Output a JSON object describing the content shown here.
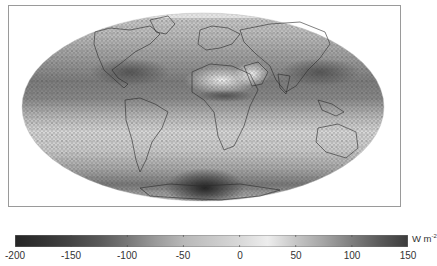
{
  "figure": {
    "projection": "Mollweide (global)",
    "map_description": "Global grayscale field with hatched stipple pattern; coastlines overlaid",
    "colorbar": {
      "unit": "W m",
      "unit_superscript": "-2",
      "min": -200,
      "max": 150,
      "ticks": [
        {
          "value": -200,
          "label": "-200"
        },
        {
          "value": -150,
          "label": "-150"
        },
        {
          "value": -100,
          "label": "-100"
        },
        {
          "value": -50,
          "label": "-50"
        },
        {
          "value": 0,
          "label": "0"
        },
        {
          "value": 50,
          "label": "50"
        },
        {
          "value": 100,
          "label": "100"
        },
        {
          "value": 150,
          "label": "150"
        }
      ],
      "gradient_stops": [
        {
          "value": -200,
          "color": "#262626"
        },
        {
          "value": -175,
          "color": "#333333"
        },
        {
          "value": -150,
          "color": "#444444"
        },
        {
          "value": -125,
          "color": "#595959"
        },
        {
          "value": -100,
          "color": "#777777"
        },
        {
          "value": -75,
          "color": "#9a9a9a"
        },
        {
          "value": -50,
          "color": "#b8b8b8"
        },
        {
          "value": -25,
          "color": "#c8c8c8"
        },
        {
          "value": 0,
          "color": "#d8d8d8"
        },
        {
          "value": 25,
          "color": "#ededed"
        },
        {
          "value": 50,
          "color": "#c6c6c6"
        },
        {
          "value": 75,
          "color": "#a4a4a4"
        },
        {
          "value": 100,
          "color": "#7e7e7e"
        },
        {
          "value": 125,
          "color": "#5a5a5a"
        },
        {
          "value": 150,
          "color": "#3c3c3c"
        }
      ]
    },
    "map_regions": [
      {
        "region": "Sahara / Arabia",
        "tone": "very light (~0 to +25)"
      },
      {
        "region": "Tropical oceans",
        "tone": "medium-dark bands"
      },
      {
        "region": "Southern Ocean",
        "tone": "light bands"
      },
      {
        "region": "Antarctica coast (below S. America/Africa)",
        "tone": "very dark (~-200)"
      },
      {
        "region": "Subtropical Atlantic/Pacific N",
        "tone": "dark (~-100 to -150)"
      }
    ]
  }
}
